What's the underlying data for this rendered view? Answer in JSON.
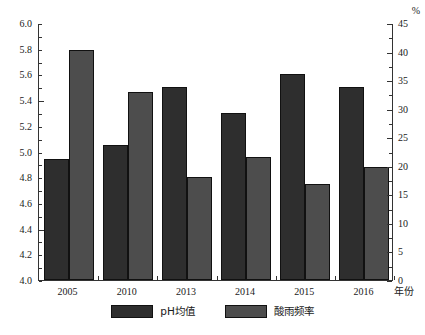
{
  "chart_data": {
    "type": "bar",
    "title": "",
    "xlabel": "年份",
    "ylabel": "",
    "y2label": "%",
    "categories": [
      "2005",
      "2010",
      "2013",
      "2014",
      "2015",
      "2016"
    ],
    "series": [
      {
        "name": "pH均值",
        "axis": "left",
        "color": "#2e2e2e",
        "values": [
          4.94,
          5.05,
          5.5,
          5.3,
          5.6,
          5.5
        ]
      },
      {
        "name": "酸雨频率",
        "axis": "right",
        "color": "#4d4d4d",
        "values": [
          40.2,
          33.0,
          18.0,
          21.5,
          16.8,
          19.8
        ]
      }
    ],
    "left_axis": {
      "min": 4.0,
      "max": 6.0,
      "step": 0.2,
      "minor_step": 0.1,
      "ticks": [
        "4.0",
        "4.2",
        "4.4",
        "4.6",
        "4.8",
        "5.0",
        "5.2",
        "5.4",
        "5.6",
        "5.8",
        "6.0"
      ]
    },
    "right_axis": {
      "min": 0,
      "max": 45,
      "step": 5,
      "minor_step": 2.5,
      "unit": "%",
      "ticks": [
        "0",
        "5",
        "10",
        "15",
        "20",
        "25",
        "30",
        "35",
        "40",
        "45"
      ]
    },
    "grid": false,
    "legend_position": "bottom-center"
  }
}
